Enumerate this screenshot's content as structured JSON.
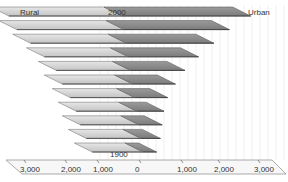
{
  "chart_data": {
    "type": "bar",
    "orientation": "horizontal",
    "style": "3d-butterfly",
    "title": "",
    "categories": [
      "2000",
      "1990",
      "1980",
      "1970",
      "1960",
      "1950",
      "1940",
      "1930",
      "1920",
      "1910",
      "1900"
    ],
    "series": [
      {
        "name": "Rural",
        "side": "left",
        "values": [
          2900,
          2750,
          2450,
          2150,
          1900,
          1800,
          1650,
          1550,
          1500,
          1400,
          1300
        ]
      },
      {
        "name": "Urban",
        "side": "right",
        "values": [
          3300,
          2700,
          2250,
          1800,
          1400,
          1100,
          850,
          700,
          600,
          500,
          350
        ]
      }
    ],
    "series_labels": {
      "left": "Rural",
      "right": "Urban"
    },
    "category_labels_shown": {
      "top": "2000",
      "bottom": "1900"
    },
    "x_ticks": [
      "3,000",
      "2,000",
      "1,000",
      "0",
      "1,000",
      "2,000",
      "3,000"
    ],
    "xlim": [
      -3000,
      3000
    ],
    "xlabel": "",
    "ylabel": "",
    "colors": {
      "rural": "#d4d4d4",
      "urban": "#8e8e8e",
      "background": "#f2f2f2"
    },
    "grid": true,
    "legend": "none"
  },
  "labels": {
    "rural": "Rural",
    "urban": "Urban",
    "top_year": "2000",
    "bottom_year": "1900",
    "ticks": [
      "3,000",
      "2,000",
      "1,000",
      "0",
      "1,000",
      "2,000",
      "3,000"
    ]
  }
}
